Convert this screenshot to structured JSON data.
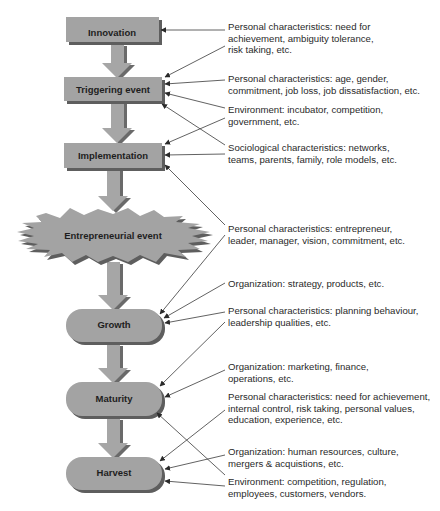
{
  "colors": {
    "box_fill": "#a3a3a3",
    "box_shadow": "#5e5e5e",
    "arrow_fill": "#a6a6a6",
    "arrow_shadow": "#6a6a6a",
    "connector": "#3a3a3a",
    "text": "#2a2a2a"
  },
  "stages": [
    {
      "id": "innovation",
      "label": "Innovation",
      "shape": "rectangle"
    },
    {
      "id": "triggering-event",
      "label": "Triggering event",
      "shape": "rectangle"
    },
    {
      "id": "implementation",
      "label": "Implementation",
      "shape": "rectangle"
    },
    {
      "id": "entrepreneurial-event",
      "label": "Entrepreneurial event",
      "shape": "starburst"
    },
    {
      "id": "growth",
      "label": "Growth",
      "shape": "pill"
    },
    {
      "id": "maturity",
      "label": "Maturity",
      "shape": "pill"
    },
    {
      "id": "harvest",
      "label": "Harvest",
      "shape": "pill"
    }
  ],
  "factors": [
    {
      "text": "Personal characteristics: need for\nachievement, ambiguity tolerance,\nrisk taking, etc.",
      "targets": [
        "innovation",
        "triggering-event"
      ]
    },
    {
      "text": "Personal characteristics: age, gender,\ncommitment, job loss, job dissatisfaction, etc.",
      "targets": [
        "triggering-event"
      ]
    },
    {
      "text": "Environment: incubator, competition,\ngovernment, etc.",
      "targets": [
        "triggering-event",
        "implementation"
      ]
    },
    {
      "text": "Sociological characteristics: networks,\nteams, parents, family, role models, etc.",
      "targets": [
        "triggering-event",
        "implementation"
      ]
    },
    {
      "text": "Personal characteristics: entrepreneur,\nleader, manager, vision, commitment, etc.",
      "targets": [
        "implementation",
        "growth"
      ]
    },
    {
      "text": "Organization: strategy, products, etc.",
      "targets": [
        "growth"
      ]
    },
    {
      "text": "Personal characteristics: planning behaviour,\nleadership qualities, etc.",
      "targets": [
        "growth",
        "maturity"
      ]
    },
    {
      "text": "Organization: marketing, finance,\noperations, etc.",
      "targets": [
        "maturity"
      ]
    },
    {
      "text": "Personal characteristics: need for achievement,\ninternal control, risk taking, personal values,\neducation, experience, etc.",
      "targets": [
        "harvest"
      ]
    },
    {
      "text": "Organization: human resources, culture,\nmergers & acquistions, etc.",
      "targets": [
        "harvest",
        "maturity"
      ]
    },
    {
      "text": "Environment: competition, regulation,\nemployees, customers, vendors.",
      "targets": [
        "harvest"
      ]
    }
  ]
}
